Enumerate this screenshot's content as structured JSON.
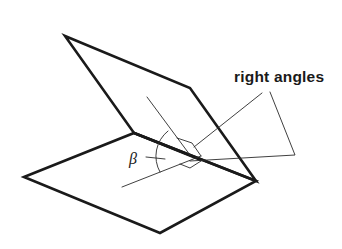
{
  "diagram": {
    "labels": {
      "right_angles": "right angles",
      "beta": "β"
    },
    "colors": {
      "stroke": "#1a1a1a",
      "background": "#ffffff"
    },
    "planes": [
      {
        "name": "upper-plane",
        "points": [
          [
            65,
            36
          ],
          [
            190,
            88
          ],
          [
            256,
            181
          ],
          [
            134,
            133
          ]
        ]
      },
      {
        "name": "lower-plane",
        "points": [
          [
            24,
            177
          ],
          [
            134,
            133
          ],
          [
            256,
            181
          ],
          [
            160,
            233
          ]
        ]
      }
    ],
    "hinge_line": [
      [
        134,
        133
      ],
      [
        256,
        181
      ]
    ],
    "perpendiculars": [
      {
        "name": "upper-perpendicular",
        "from": [
          147,
          97
        ],
        "to": [
          190,
          155
        ]
      },
      {
        "name": "lower-perpendicular",
        "from": [
          122,
          187
        ],
        "to": [
          201,
          156
        ]
      }
    ],
    "leaders": [
      {
        "name": "leader-upper-right-angle",
        "points": [
          [
            262,
            93
          ],
          [
            194,
            147
          ]
        ]
      },
      {
        "name": "leader-lower-right-angle",
        "points": [
          [
            270,
            92
          ],
          [
            295,
            155
          ],
          [
            190,
            161
          ]
        ]
      }
    ]
  }
}
